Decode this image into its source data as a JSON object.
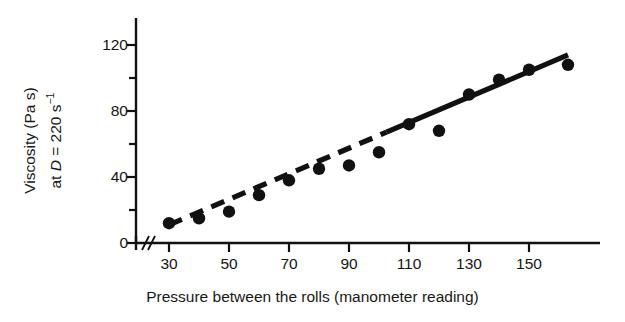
{
  "chart_data": {
    "type": "scatter",
    "title": "",
    "xlabel": "Pressure between the rolls (manometer reading)",
    "ylabel_line1": "Viscosity (Pa s)",
    "ylabel_line2_prefix": "at ",
    "ylabel_line2_var": "D",
    "ylabel_line2_rest": " = 220 s",
    "ylabel_line2_sup": "−1",
    "x": [
      30,
      40,
      50,
      60,
      70,
      80,
      90,
      100,
      110,
      120,
      130,
      140,
      150,
      163
    ],
    "values": [
      12,
      15,
      19,
      29,
      38,
      45,
      47,
      55,
      72,
      68,
      90,
      99,
      105,
      108
    ],
    "series": [
      {
        "name": "Viscosity at D = 220 s^-1",
        "marker": "filled-circle",
        "marker_color": "#111111",
        "values": [
          12,
          15,
          19,
          29,
          38,
          45,
          47,
          55,
          72,
          68,
          90,
          99,
          105,
          108
        ]
      }
    ],
    "trendline": {
      "style": "dashed-to-solid",
      "x_start": 30,
      "y_start": 11,
      "x_end": 163,
      "y_end": 114,
      "color": "#111111"
    },
    "xlim": [
      22,
      175
    ],
    "ylim": [
      0,
      132
    ],
    "axis_break": true,
    "axis_break_note": "//",
    "grid": false,
    "legend": null,
    "xticks_major": [
      30,
      50,
      70,
      90,
      110,
      130,
      150
    ],
    "xticks_major_labels": [
      "30",
      "50",
      "70",
      "90",
      "110",
      "130",
      "150"
    ],
    "xticks_minor": [],
    "yticks_major": [
      0,
      40,
      80,
      120
    ],
    "yticks_major_labels": [
      "0",
      "40",
      "80",
      "120"
    ],
    "yticks_minor": [
      20,
      60,
      100
    ],
    "axis_color": "#111111"
  },
  "axes": {
    "x_title": "Pressure between the rolls (manometer reading)",
    "y_title_l1": "Viscosity (Pa s)",
    "y_title_l2": "at D = 220 s⁻¹"
  }
}
